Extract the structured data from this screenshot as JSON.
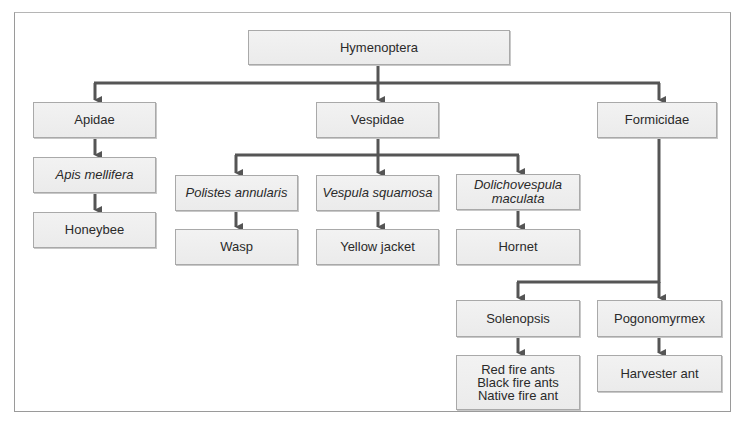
{
  "diagram": {
    "type": "taxonomy-tree",
    "root": "Hymenoptera",
    "nodes": {
      "root": {
        "label": "Hymenoptera",
        "italic": false
      },
      "apidae": {
        "label": "Apidae",
        "italic": false
      },
      "vespidae": {
        "label": "Vespidae",
        "italic": false
      },
      "formicidae": {
        "label": "Formicidae",
        "italic": false
      },
      "apis": {
        "label": "Apis mellifera",
        "italic": true
      },
      "honeybee": {
        "label": "Honeybee",
        "italic": false
      },
      "polistes": {
        "label": "Polistes annularis",
        "italic": true
      },
      "vespula": {
        "label": "Vespula squamosa",
        "italic": true
      },
      "dolicho": {
        "line1": "Dolichovespula",
        "line2": "maculata",
        "italic": true
      },
      "wasp": {
        "label": "Wasp",
        "italic": false
      },
      "yellowjacket": {
        "label": "Yellow jacket",
        "italic": false
      },
      "hornet": {
        "label": "Hornet",
        "italic": false
      },
      "solenopsis": {
        "label": "Solenopsis",
        "italic": false
      },
      "pogonomyrmex": {
        "label": "Pogonomyrmex",
        "italic": false
      },
      "fireants": {
        "line1": "Red fire ants",
        "line2": "Black fire ants",
        "line3": "Native fire ant",
        "italic": false
      },
      "harvester": {
        "label": "Harvester ant",
        "italic": false
      }
    },
    "edges": [
      [
        "Hymenoptera",
        "Apidae"
      ],
      [
        "Hymenoptera",
        "Vespidae"
      ],
      [
        "Hymenoptera",
        "Formicidae"
      ],
      [
        "Apidae",
        "Apis mellifera"
      ],
      [
        "Apis mellifera",
        "Honeybee"
      ],
      [
        "Vespidae",
        "Polistes annularis"
      ],
      [
        "Vespidae",
        "Vespula squamosa"
      ],
      [
        "Vespidae",
        "Dolichovespula maculata"
      ],
      [
        "Polistes annularis",
        "Wasp"
      ],
      [
        "Vespula squamosa",
        "Yellow jacket"
      ],
      [
        "Dolichovespula maculata",
        "Hornet"
      ],
      [
        "Formicidae",
        "Solenopsis"
      ],
      [
        "Formicidae",
        "Pogonomyrmex"
      ],
      [
        "Solenopsis",
        "Red fire ants / Black fire ants / Native fire ant"
      ],
      [
        "Pogonomyrmex",
        "Harvester ant"
      ]
    ],
    "colors": {
      "line": "#555555",
      "box_fill": "#efefef",
      "box_border": "#a9a9a9",
      "frame": "#9a9a9a"
    }
  }
}
